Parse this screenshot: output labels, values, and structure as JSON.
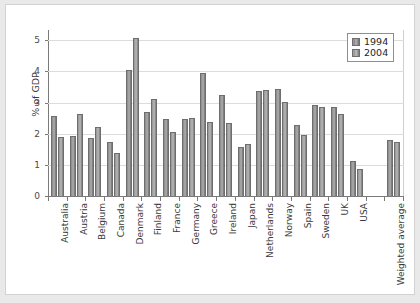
{
  "chart_data": {
    "type": "bar",
    "title": "",
    "xlabel": "",
    "ylabel": "% of GDP",
    "ylim": [
      0,
      5.3
    ],
    "yticks": [
      0,
      1,
      2,
      3,
      4,
      5
    ],
    "ytick_labels": [
      "0",
      "1",
      "2",
      "3",
      "4",
      "5"
    ],
    "grid": true,
    "legend_position": "top-right",
    "categories": [
      "Australia",
      "Austria",
      "Belgium",
      "Canada",
      "Denmark",
      "Finland",
      "France",
      "Germany",
      "Greece",
      "Ireland",
      "Japan",
      "Netherlands",
      "Norway",
      "Spain",
      "Sweden",
      "UK",
      "USA",
      "",
      "Weighted average"
    ],
    "series": [
      {
        "name": "1994",
        "color": "#8d8d8d",
        "values": [
          2.58,
          1.94,
          1.85,
          1.72,
          4.05,
          2.7,
          2.46,
          2.46,
          3.95,
          3.25,
          1.58,
          3.38,
          3.44,
          2.29,
          2.91,
          2.85,
          1.13,
          null,
          1.8
        ]
      },
      {
        "name": "2004",
        "color": "#9b9b9b",
        "values": [
          1.9,
          2.65,
          2.21,
          1.38,
          5.08,
          3.11,
          2.06,
          2.52,
          2.37,
          2.35,
          1.67,
          3.41,
          3.02,
          1.97,
          2.87,
          2.62,
          0.86,
          null,
          1.72
        ]
      }
    ]
  },
  "legend": {
    "entries": [
      "1994",
      "2004"
    ]
  }
}
